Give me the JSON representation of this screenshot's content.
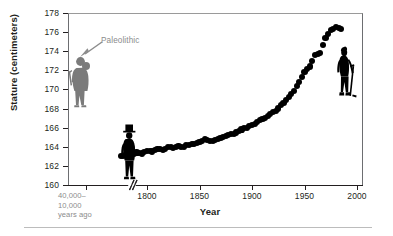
{
  "chart_data": {
    "type": "scatter",
    "title": "",
    "xlabel": "Year",
    "ylabel": "Stature (centimeters)",
    "ylim": [
      160,
      178
    ],
    "yticks": [
      160,
      162,
      164,
      166,
      168,
      170,
      172,
      174,
      176,
      178
    ],
    "xticks": [
      "40,000–\n10,000\nyears ago",
      "1800",
      "1850",
      "1900",
      "1950",
      "2000"
    ],
    "grid": false,
    "legend": "none",
    "axis_break": true,
    "axis_break_note": "broken x-axis between Paleolithic era and 1800",
    "annotations": [
      {
        "text": "Paleolithic",
        "points_to_x": "40,000-10,000 years ago",
        "points_to_y": 172.5,
        "color": "#8c8c8c"
      }
    ],
    "series": [
      {
        "name": "Paleolithic stature",
        "color": "#7b7b7b",
        "points": [
          [
            0,
            172.5
          ]
        ]
      },
      {
        "name": "Historical male stature",
        "color": "#000000",
        "x": [
          1775,
          1780,
          1785,
          1790,
          1795,
          1800,
          1805,
          1810,
          1815,
          1820,
          1825,
          1830,
          1835,
          1840,
          1845,
          1850,
          1855,
          1860,
          1865,
          1870,
          1875,
          1880,
          1885,
          1890,
          1895,
          1900,
          1905,
          1910,
          1915,
          1920,
          1925,
          1930,
          1935,
          1940,
          1950,
          1955,
          1960,
          1965,
          1970,
          1975,
          1980,
          1985
        ],
        "values": [
          163.0,
          163.2,
          163.1,
          163.4,
          163.3,
          163.6,
          163.5,
          163.8,
          163.7,
          164.0,
          163.9,
          164.1,
          164.0,
          164.2,
          164.3,
          164.5,
          164.8,
          164.6,
          164.7,
          164.9,
          165.1,
          165.3,
          165.5,
          165.8,
          166.0,
          166.3,
          166.6,
          166.9,
          167.2,
          167.6,
          168.0,
          168.6,
          169.2,
          169.8,
          171.8,
          172.4,
          173.6,
          173.8,
          175.4,
          176.2,
          176.5,
          176.3
        ]
      }
    ]
  },
  "figures": {
    "paleolithic": {
      "label": "paleolithic-hunter-figure",
      "color": "#7b7b7b",
      "holding": "spear"
    },
    "nineteenth_century": {
      "label": "19th-century-man-figure",
      "color": "#000000",
      "holding": "top-hat"
    },
    "modern": {
      "label": "modern-golfer-figure",
      "color": "#000000",
      "holding": "golf-club"
    }
  },
  "axis": {
    "y_title": "Stature (centimeters)",
    "x_title": "Year",
    "y_labels": [
      "178",
      "176",
      "174",
      "172",
      "170",
      "168",
      "166",
      "164",
      "162",
      "160"
    ],
    "x_labels": [
      "1800",
      "1850",
      "1900",
      "1950",
      "2000"
    ],
    "x_paleo_label_line1": "40,000–",
    "x_paleo_label_line2": "10,000",
    "x_paleo_label_line3": "years ago"
  },
  "annotation": {
    "paleolithic_label": "Paleolithic"
  }
}
